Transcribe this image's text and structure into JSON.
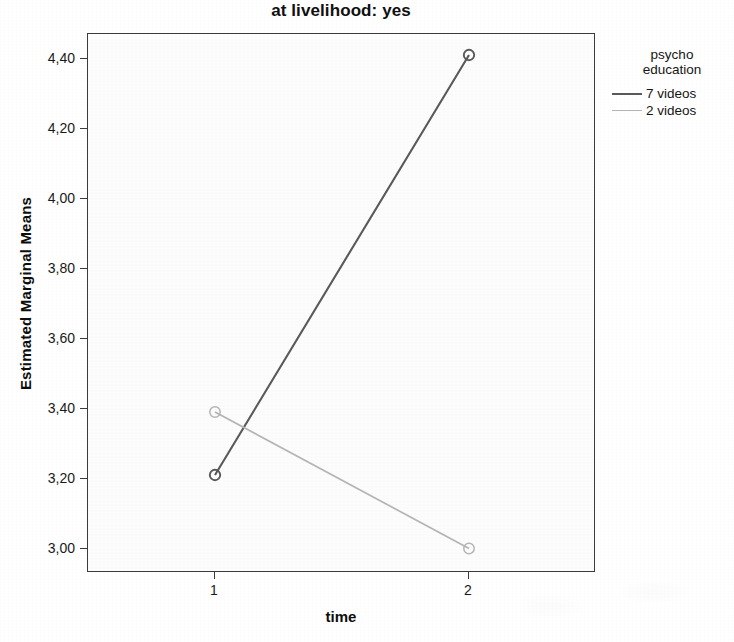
{
  "chart_data": {
    "type": "line",
    "title": "at livelihood: yes",
    "xlabel": "time",
    "ylabel": "Estimated Marginal Means",
    "x": [
      1,
      2
    ],
    "x_tick_labels": [
      "1",
      "2"
    ],
    "y_tick_labels": [
      "3,00",
      "3,20",
      "3,40",
      "3,60",
      "3,80",
      "4,00",
      "4,20",
      "4,40"
    ],
    "y_tick_values": [
      3.0,
      3.2,
      3.4,
      3.6,
      3.8,
      4.0,
      4.2,
      4.4
    ],
    "ylim": [
      2.93,
      4.47
    ],
    "xlim": [
      0.5,
      2.5
    ],
    "grid": false,
    "legend_position": "right",
    "legend_title": "psycho\neducation",
    "marker": "open-circle",
    "series": [
      {
        "name": "7 videos",
        "values": [
          3.21,
          4.41
        ],
        "color": "#595959"
      },
      {
        "name": "2 videos",
        "values": [
          3.39,
          3.0
        ],
        "color": "#b4b4b4"
      }
    ]
  },
  "legend": {
    "title": "psycho\neducation",
    "entries": [
      {
        "label": "7 videos",
        "color": "#595959"
      },
      {
        "label": "2 videos",
        "color": "#b4b4b4"
      }
    ]
  }
}
